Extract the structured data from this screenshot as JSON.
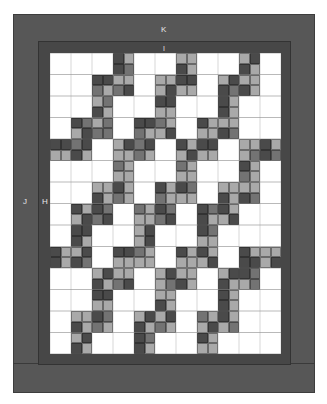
{
  "diagram": {
    "type": "quilt-layout",
    "labels": {
      "outer_border": "K",
      "inner_border_top": "I",
      "outer_border_side": "J",
      "inner_border_side": "H"
    },
    "colors": {
      "W": "#ffffff",
      "L": "#a9a9a9",
      "M": "#737373",
      "D": "#4a4a4a",
      "outer_border": "#575757",
      "inner_border": "#474747"
    },
    "grid": {
      "cols": 22,
      "rows": 28,
      "cells": [
        "WWWWWWDLWWWWLLWWWWLDWW",
        "WWWWWWDMWWWWDLWWWWDLWW",
        "WWWWDDLLWWLLDDWWLDLLWW",
        "WWWWMLMDWWLDLLWWDMDLWW",
        "WWWWLMWWWWDDWWWWDLWWWW",
        "WWWWDLWWWWLLWWWWDLWWWW",
        "WWDMLMWWDDMLWWDLLLWWWW",
        "WWLDMMWWMLLDWWLLDMWWWW",
        "DDMDWWLDMDWWDLDDWWLLDL",
        "LLDLWWLLMLWWLDLLWWLMDM",
        "WWWWWWMLWWWWMLWWWWDLWW",
        "WWWWWWLLWWWWLLWWWWMLWW",
        "WWWWLLDLWWDLDMWWLLLLWW",
        "WWWWDLMLWWMLLLWWDLDMWW",
        "WWDLDMWWMLDMWWDMDLWWWW",
        "WWLDMDWWLLMDWWDLLDWWWW",
        "WWDDWWWWLDWWWWDMWWWWWW",
        "WWDLWWWWLDWWWWLLWWWWWW",
        "DLLDWWDDMLWWDLDLWWDLLL",
        "DLDMWWLLLLWWLLLDWWDDLD",
        "WWWWLDLLWWLDLLWWLDDMWW",
        "WWWWDLMDWWLMDLWWDLLMWW",
        "WWWWDDWWWWLLWWWWDLWWWW",
        "WWWWLLWWWWDLWWWWDLWWWW",
        "WWLLDMWWLDLDWWMLDLWWWW",
        "WWDLMLWWDLMLWWLDLMWWWW",
        "WWLDWWWWDMWWWWDLWWWWWW",
        "WWDLWWWWDLWWWWLLWWWWWW"
      ]
    }
  }
}
